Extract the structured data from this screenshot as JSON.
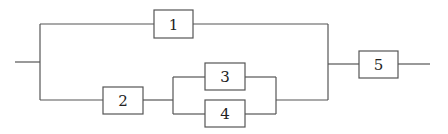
{
  "diagram": {
    "type": "reliability-block-diagram",
    "line_color": "#555555",
    "blocks": [
      {
        "id": "1",
        "label": "1"
      },
      {
        "id": "2",
        "label": "2"
      },
      {
        "id": "3",
        "label": "3"
      },
      {
        "id": "4",
        "label": "4"
      },
      {
        "id": "5",
        "label": "5"
      }
    ],
    "structure": "((1) || (2 -> (3 || 4))) -> 5"
  }
}
